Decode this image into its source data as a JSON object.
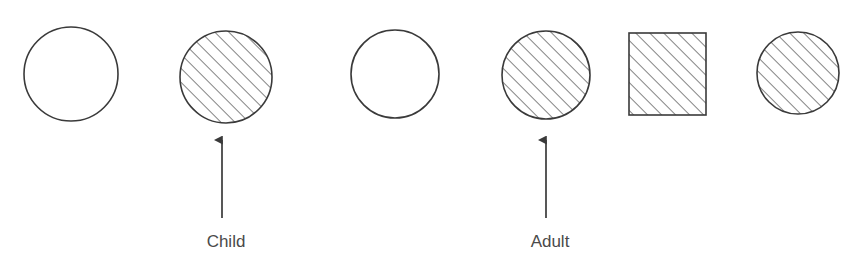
{
  "diagram": {
    "canvas": {
      "width": 858,
      "height": 260,
      "background": "#ffffff"
    },
    "style": {
      "outline_color": "#3a3a3a",
      "hatch_color": "#4a4a4a",
      "arrow_color": "#3a3a3a",
      "text_color": "#4a4a4a",
      "hatch_angle_deg": 45,
      "hatch_spacing_px": 7
    },
    "shapes": [
      {
        "index": 1,
        "kind": "circle",
        "fill": "open",
        "name": "circle-open-1",
        "cx": 71,
        "cy": 74,
        "r": 47
      },
      {
        "index": 2,
        "kind": "circle",
        "fill": "hatched",
        "name": "circle-hatched-child",
        "cx": 226,
        "cy": 77,
        "r": 46
      },
      {
        "index": 3,
        "kind": "circle",
        "fill": "open",
        "name": "circle-open-2",
        "cx": 395,
        "cy": 74,
        "r": 44
      },
      {
        "index": 4,
        "kind": "circle",
        "fill": "hatched",
        "name": "circle-hatched-adult",
        "cx": 546,
        "cy": 75,
        "r": 44
      },
      {
        "index": 5,
        "kind": "square",
        "fill": "hatched",
        "name": "square-hatched",
        "x": 629,
        "y": 33,
        "width": 77,
        "height": 82
      },
      {
        "index": 6,
        "kind": "circle",
        "fill": "hatched",
        "name": "circle-hatched-3",
        "cx": 798,
        "cy": 73,
        "r": 41
      }
    ],
    "annotations": [
      {
        "label": "Child",
        "name": "annotation-child",
        "points_to_shape": 2,
        "arrow": {
          "x": 222,
          "y_tip": 136,
          "y_tail": 218
        },
        "text": {
          "x": 226,
          "y": 247
        }
      },
      {
        "label": "Adult",
        "name": "annotation-adult",
        "points_to_shape": 4,
        "arrow": {
          "x": 546,
          "y_tip": 136,
          "y_tail": 218
        },
        "text": {
          "x": 550,
          "y": 247
        }
      }
    ]
  }
}
